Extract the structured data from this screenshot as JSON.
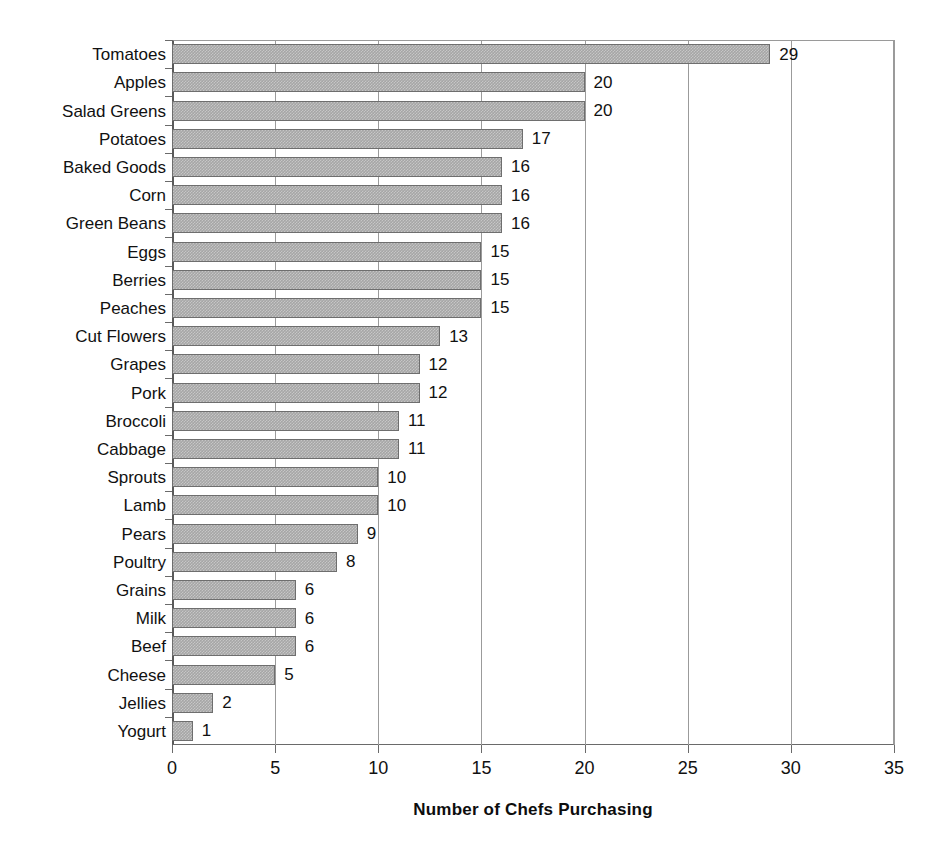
{
  "chart_data": {
    "type": "bar",
    "orientation": "horizontal",
    "title": "",
    "xlabel": "Number of Chefs Purchasing",
    "ylabel": "",
    "xlim": [
      0,
      35
    ],
    "xticks": [
      0,
      5,
      10,
      15,
      20,
      25,
      30,
      35
    ],
    "grid": "vertical",
    "legend": "none",
    "bar_color": "#a6a6a6",
    "bar_border_color": "#6e6e6e",
    "show_value_labels": true,
    "categories": [
      "Tomatoes",
      "Apples",
      "Salad Greens",
      "Potatoes",
      "Baked Goods",
      "Corn",
      "Green Beans",
      "Eggs",
      "Berries",
      "Peaches",
      "Cut Flowers",
      "Grapes",
      "Pork",
      "Broccoli",
      "Cabbage",
      "Sprouts",
      "Lamb",
      "Pears",
      "Poultry",
      "Grains",
      "Milk",
      "Beef",
      "Cheese",
      "Jellies",
      "Yogurt"
    ],
    "values": [
      29,
      20,
      20,
      17,
      16,
      16,
      16,
      15,
      15,
      15,
      13,
      12,
      12,
      11,
      11,
      10,
      10,
      9,
      8,
      6,
      6,
      6,
      5,
      2,
      1
    ]
  }
}
